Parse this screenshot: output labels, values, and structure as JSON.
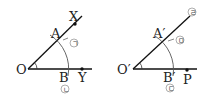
{
  "figures": [
    {
      "name": "original-angle",
      "vertex_label": "O",
      "point_on_upper_ray_label": "X",
      "point_on_lower_ray_label": "Y",
      "arc_upper_intersection_label": "A",
      "arc_lower_intersection_label": "B",
      "step_markers": {
        "arc_upper": "㉠",
        "arc_lower": "㉡"
      }
    },
    {
      "name": "copied-angle",
      "vertex_label": "O′",
      "point_on_lower_ray_label": "P",
      "arc_upper_intersection_label": "A′",
      "arc_lower_intersection_label": "B′",
      "step_markers": {
        "ray_end": "㉣",
        "arc_upper": "㉤",
        "arc_lower": "㉢"
      }
    }
  ],
  "colors": {
    "line": "#111111",
    "arc": "#555555",
    "marker": "#666666"
  }
}
